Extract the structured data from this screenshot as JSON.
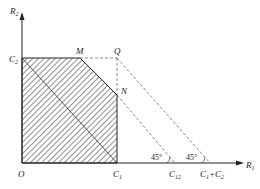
{
  "diagram": {
    "axes": {
      "x_label": "R",
      "x_sub": "1",
      "y_label": "R",
      "y_sub": "2",
      "origin": "O"
    },
    "points": {
      "C2": {
        "label": "C",
        "sub": "2"
      },
      "M": {
        "label": "M"
      },
      "Q": {
        "label": "Q"
      },
      "N": {
        "label": "N"
      },
      "C1": {
        "label": "C",
        "sub": "1"
      },
      "C12": {
        "label": "C",
        "sub": "12"
      },
      "C1C2": {
        "label": "C",
        "sub1": "1",
        "plus": "+C",
        "sub2": "2"
      }
    },
    "angles": [
      "45°",
      "45°"
    ],
    "colors": {
      "line": "#222222",
      "dash": "#555555"
    }
  }
}
